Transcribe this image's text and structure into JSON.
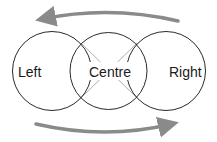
{
  "diagram": {
    "circles": [
      {
        "label": "Left"
      },
      {
        "label": "Centre"
      },
      {
        "label": "Right"
      }
    ],
    "arrows": [
      {
        "direction": "right-to-left",
        "position": "top"
      },
      {
        "direction": "left-to-right",
        "position": "bottom"
      }
    ],
    "colors": {
      "circle_stroke": "#2a2a2a",
      "cross_lines": "#b0b0b0",
      "arrow": "#8a8a8a",
      "text": "#1a1a1a"
    }
  }
}
